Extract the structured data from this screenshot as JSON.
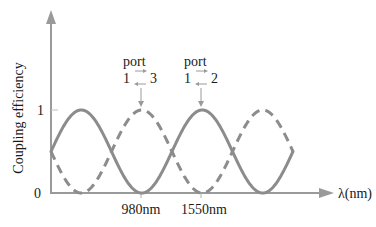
{
  "chart_data": {
    "type": "line",
    "title": "",
    "xlabel": "λ(nm)",
    "ylabel": "Coupling efficiency",
    "ylim": [
      0,
      1
    ],
    "yticks": [
      "0",
      "1"
    ],
    "xtick_labels": [
      "980nm",
      "1550nm"
    ],
    "grid": false,
    "legend": null,
    "series": [
      {
        "name": "port 1 → 2 (solid)",
        "style": "solid",
        "description": "sinusoid starting at 0.5, peaks at 1, trough (0) at 980nm, peak (1) at 1550nm",
        "x_relative": [
          0,
          0.125,
          0.25,
          0.375,
          0.5,
          0.625,
          0.75,
          0.875,
          1.0
        ],
        "values": [
          0.5,
          1,
          0.5,
          0,
          0.5,
          1,
          0.5,
          0,
          0.5
        ]
      },
      {
        "name": "port 1 → 3 (dashed)",
        "style": "dashed",
        "description": "complementary sinusoid: peak (1) at 980nm, trough (0) at 1550nm",
        "x_relative": [
          0,
          0.125,
          0.25,
          0.375,
          0.5,
          0.625,
          0.75,
          0.875,
          1.0
        ],
        "values": [
          0.5,
          0,
          0.5,
          1,
          0.5,
          0,
          0.5,
          1,
          0.5
        ]
      }
    ],
    "annotations": [
      {
        "text": "port",
        "line2_left": "1",
        "line2_right": "3",
        "points_to": "dashed peak at 980nm"
      },
      {
        "text": "port",
        "line2_left": "1",
        "line2_right": "2",
        "points_to": "solid peak at 1550nm"
      }
    ],
    "colors": {
      "curve": "#8c8c8c",
      "axis": "#9a9a9a",
      "text": "#1a1a1a"
    }
  }
}
